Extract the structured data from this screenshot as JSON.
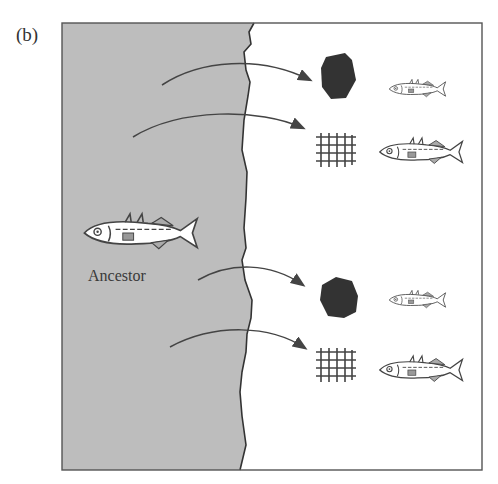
{
  "figure": {
    "panel_label": "(b)",
    "ancestor_label": "Ancestor",
    "colors": {
      "marine_fill": "#bdbdbd",
      "freshwater_fill": "#ffffff",
      "line": "#444444",
      "rock": "#333333"
    },
    "ancestor": {
      "name": "ancestral-stickleback",
      "habitat": "marine (gray region)"
    },
    "descendant_pairs": [
      {
        "habitat_icon": "rock-icon",
        "fish_size": "small",
        "arrow_index": 1
      },
      {
        "habitat_icon": "grid-vegetation-icon",
        "fish_size": "large",
        "arrow_index": 2
      },
      {
        "habitat_icon": "rock-icon",
        "fish_size": "small",
        "arrow_index": 3
      },
      {
        "habitat_icon": "grid-vegetation-icon",
        "fish_size": "large",
        "arrow_index": 4
      }
    ]
  }
}
